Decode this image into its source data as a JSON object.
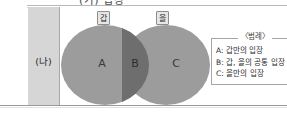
{
  "figure": {
    "header_row_text": "(가) 입장",
    "row_label": "(나)"
  },
  "venn": {
    "left_tag": "갑",
    "right_tag": "을",
    "regions": [
      {
        "letter": "A"
      },
      {
        "letter": "B"
      },
      {
        "letter": "C"
      }
    ]
  },
  "legend": {
    "title": "〈범례〉",
    "items": [
      "A: 갑만의 입장",
      "B: 갑, 을의 공통 입장",
      "C: 을만의 입장"
    ]
  },
  "colors": {
    "circle_fill": "#9c9c9c",
    "intersection_fill": "#6e6e6e",
    "label_cell_bg": "#d6d6d6",
    "rule": "#a8a8a8"
  }
}
